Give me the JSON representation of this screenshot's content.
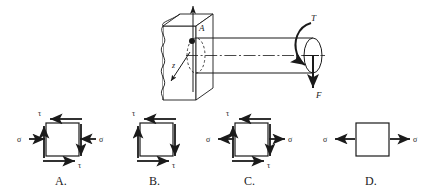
{
  "figure": {
    "background_color": "#ffffff",
    "line_color": "#1a1a1a"
  },
  "main_diagram": {
    "name": "cantilever-shaft-diagram",
    "point_label": "A",
    "axis_z_label": "z",
    "torque_label": "T",
    "force_label": "F",
    "wall_description": "fixed wall block with break line",
    "shaft_description": "horizontal cylindrical shaft with dash-dot centerline",
    "vertical_axis_description": "vertical y axis arrow pointing up at wall face"
  },
  "options": [
    {
      "id": "A",
      "label": "A.",
      "name": "option-a-stress-element",
      "normal_stress_symbol": "σ",
      "shear_stress_symbol": "τ",
      "normal_stress_sense": "compression",
      "shear_sense": "top-arrow-left-bottom-arrow-right",
      "has_normal": true,
      "has_shear": true,
      "top_tau_label": "τ",
      "bottom_tau_label": "τ",
      "left_sigma_label": "σ",
      "right_sigma_label": "σ"
    },
    {
      "id": "B",
      "label": "B.",
      "name": "option-b-stress-element",
      "normal_stress_symbol": "σ",
      "shear_stress_symbol": "τ",
      "normal_stress_sense": "none",
      "shear_sense": "top-arrow-left-bottom-arrow-right",
      "has_normal": false,
      "has_shear": true,
      "top_tau_label": "τ",
      "bottom_tau_label": "τ",
      "left_sigma_label": "",
      "right_sigma_label": ""
    },
    {
      "id": "C",
      "label": "C.",
      "name": "option-c-stress-element",
      "normal_stress_symbol": "σ",
      "shear_stress_symbol": "τ",
      "normal_stress_sense": "tension",
      "shear_sense": "top-arrow-left-bottom-arrow-right",
      "has_normal": true,
      "has_shear": true,
      "top_tau_label": "τ",
      "bottom_tau_label": "τ",
      "left_sigma_label": "σ",
      "right_sigma_label": "σ"
    },
    {
      "id": "D",
      "label": "D.",
      "name": "option-d-stress-element",
      "normal_stress_symbol": "σ",
      "shear_stress_symbol": "τ",
      "normal_stress_sense": "tension",
      "shear_sense": "none",
      "has_normal": true,
      "has_shear": false,
      "top_tau_label": "",
      "bottom_tau_label": "",
      "left_sigma_label": "σ",
      "right_sigma_label": "σ"
    }
  ]
}
